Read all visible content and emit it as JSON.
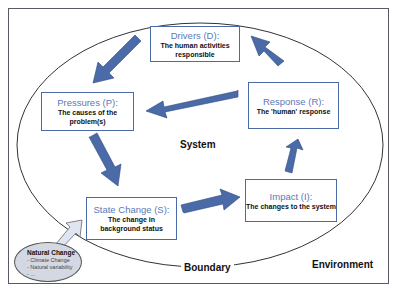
{
  "boxes": {
    "drivers": {
      "title": "Drivers (D):",
      "desc": "The human activities responsible"
    },
    "pressures": {
      "title": "Pressures (P):",
      "desc": "The causes of the problem(s)"
    },
    "response": {
      "title": "Response (R):",
      "desc": "The 'human' response"
    },
    "state": {
      "title": "State Change (S):",
      "desc": "The change in background status"
    },
    "impact": {
      "title": "Impact (I):",
      "desc": "The changes to the system"
    }
  },
  "labels": {
    "system": "System",
    "boundary": "Boundary",
    "environment": "Environment"
  },
  "natural_change": {
    "title": "Natural Change",
    "items": [
      "- Climate Change",
      "- Natural variability",
      "- ..."
    ]
  },
  "colors": {
    "arrow": "#4a6aa8",
    "box_border": "#4a6aa8",
    "title_text": "#5a7ab8",
    "natural_fill": "#d4d8e2"
  }
}
